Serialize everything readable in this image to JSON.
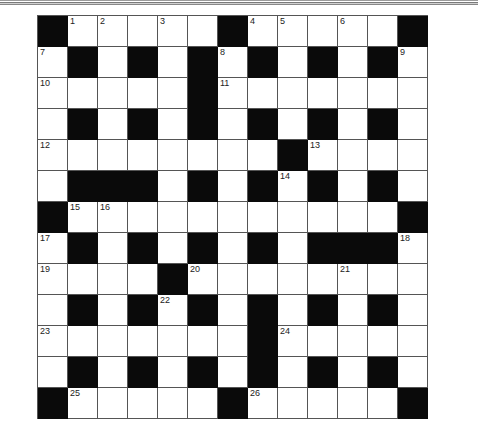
{
  "puzzle": {
    "rows": 13,
    "cols": 13,
    "colors": {
      "block": "#0a0a0a",
      "cell": "#ffffff",
      "line": "#555555"
    },
    "legend": "# = black square, . = white square, number = numbered white square",
    "grid": [
      [
        "#",
        "1",
        "2",
        ".",
        "3",
        ".",
        "#",
        "4",
        "5",
        ".",
        "6",
        ".",
        "#"
      ],
      [
        "7",
        "#",
        ".",
        "#",
        ".",
        "#",
        "8",
        "#",
        ".",
        "#",
        ".",
        "#",
        "9"
      ],
      [
        "10",
        ".",
        ".",
        ".",
        ".",
        "#",
        "11",
        ".",
        ".",
        ".",
        ".",
        ".",
        "."
      ],
      [
        ".",
        "#",
        ".",
        "#",
        ".",
        "#",
        ".",
        "#",
        ".",
        "#",
        ".",
        "#",
        "."
      ],
      [
        "12",
        ".",
        ".",
        ".",
        ".",
        ".",
        ".",
        ".",
        "#",
        "13",
        ".",
        ".",
        "."
      ],
      [
        ".",
        "#",
        "#",
        "#",
        ".",
        "#",
        ".",
        "#",
        "14",
        "#",
        ".",
        "#",
        "."
      ],
      [
        "#",
        "15",
        "16",
        ".",
        ".",
        ".",
        ".",
        ".",
        ".",
        ".",
        ".",
        ".",
        "#"
      ],
      [
        "17",
        "#",
        ".",
        "#",
        ".",
        "#",
        ".",
        "#",
        ".",
        "#",
        "#",
        "#",
        "18"
      ],
      [
        "19",
        ".",
        ".",
        ".",
        "#",
        "20",
        ".",
        ".",
        ".",
        ".",
        "21",
        ".",
        "."
      ],
      [
        ".",
        "#",
        ".",
        "#",
        "22",
        "#",
        ".",
        "#",
        ".",
        "#",
        ".",
        "#",
        "."
      ],
      [
        "23",
        ".",
        ".",
        ".",
        ".",
        ".",
        ".",
        "#",
        "24",
        ".",
        ".",
        ".",
        "."
      ],
      [
        ".",
        "#",
        ".",
        "#",
        ".",
        "#",
        ".",
        "#",
        ".",
        "#",
        ".",
        "#",
        "."
      ],
      [
        "#",
        "25",
        ".",
        ".",
        ".",
        ".",
        "#",
        "26",
        ".",
        ".",
        ".",
        ".",
        "#"
      ]
    ],
    "clue_numbers": [
      "1",
      "2",
      "3",
      "4",
      "5",
      "6",
      "7",
      "8",
      "9",
      "10",
      "11",
      "12",
      "13",
      "14",
      "15",
      "16",
      "17",
      "18",
      "19",
      "20",
      "21",
      "22",
      "23",
      "24",
      "25",
      "26"
    ]
  }
}
